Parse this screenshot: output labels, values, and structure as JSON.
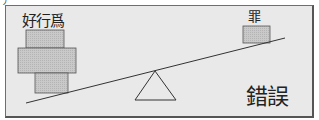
{
  "diagram": {
    "type": "seesaw-balance",
    "corner_fragment": "丿",
    "left_side": {
      "label": "好行爲",
      "blocks": [
        {
          "name": "top-block",
          "x": 26,
          "y": 30,
          "w": 38,
          "h": 18
        },
        {
          "name": "middle-block",
          "x": 18,
          "y": 48,
          "w": 58,
          "h": 25
        },
        {
          "name": "bottom-block",
          "x": 35,
          "y": 73,
          "w": 33,
          "h": 20
        }
      ]
    },
    "right_side": {
      "label": "罪",
      "blocks": [
        {
          "name": "sin-block",
          "x": 243,
          "y": 26,
          "w": 27,
          "h": 17
        }
      ]
    },
    "beam": {
      "x1": 26,
      "y1": 103,
      "x2": 285,
      "y2": 38
    },
    "fulcrum": {
      "apex_x": 155,
      "apex_y": 71,
      "base_left_x": 135,
      "base_right_x": 176,
      "base_y": 100
    },
    "verdict": "錯誤",
    "colors": {
      "background": "#e9e9e9",
      "block_fill": "#c8c8c8",
      "stroke": "#333333",
      "frame_border": "#6e6e6e"
    }
  }
}
